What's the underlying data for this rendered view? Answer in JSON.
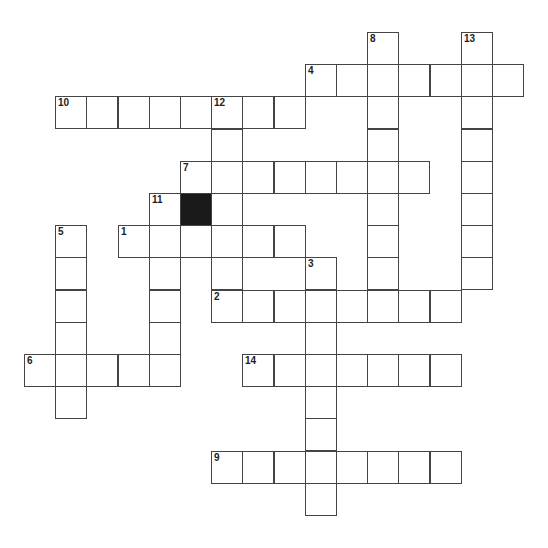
{
  "puzzle": {
    "type": "crossword",
    "cell_size_px": 31.2,
    "origin": {
      "x": 24,
      "y": 32
    },
    "words": [
      {
        "number": "1",
        "direction": "across",
        "col": 3,
        "row": 6,
        "length": 6
      },
      {
        "number": "2",
        "direction": "across",
        "col": 6,
        "row": 8,
        "length": 8
      },
      {
        "number": "3",
        "direction": "down",
        "col": 9,
        "row": 7,
        "length": 8
      },
      {
        "number": "4",
        "direction": "across",
        "col": 9,
        "row": 1,
        "length": 7
      },
      {
        "number": "5",
        "direction": "down",
        "col": 1,
        "row": 6,
        "length": 6
      },
      {
        "number": "6",
        "direction": "across",
        "col": 0,
        "row": 10,
        "length": 5
      },
      {
        "number": "7",
        "direction": "across",
        "col": 5,
        "row": 4,
        "length": 8
      },
      {
        "number": "8",
        "direction": "down",
        "col": 11,
        "row": 0,
        "length": 8
      },
      {
        "number": "9",
        "direction": "across",
        "col": 6,
        "row": 13,
        "length": 8
      },
      {
        "number": "10",
        "direction": "across",
        "col": 1,
        "row": 2,
        "length": 8
      },
      {
        "number": "11",
        "direction": "down",
        "col": 4,
        "row": 5,
        "length": 6
      },
      {
        "number": "12",
        "direction": "down",
        "col": 6,
        "row": 2,
        "length": 7
      },
      {
        "number": "13",
        "direction": "down",
        "col": 14,
        "row": 0,
        "length": 8
      },
      {
        "number": "14",
        "direction": "across",
        "col": 7,
        "row": 10,
        "length": 7
      }
    ],
    "black_cells": [
      {
        "col": 5,
        "row": 5
      }
    ],
    "colors": {
      "line": "#444444",
      "black": "#1a1a1a",
      "background": "#ffffff"
    }
  }
}
